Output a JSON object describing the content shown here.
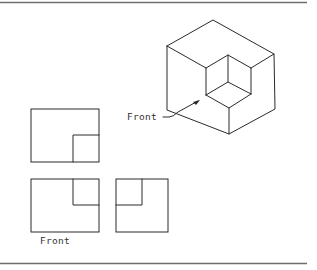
{
  "figure": {
    "isometric_label": "Front",
    "orthographic_label": "Front",
    "views": [
      "top-view",
      "front-view",
      "right-side-view"
    ]
  },
  "colors": {
    "line": "#2a2a2a",
    "rule": "#6e6e6e",
    "background": "#ffffff"
  }
}
